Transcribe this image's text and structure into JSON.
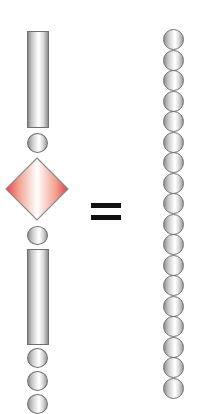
{
  "diagram": {
    "colors": {
      "cylinder_edge": "#6f6f6f",
      "bead_edge": "#707070",
      "diamond_fill_edge": "#e8404f",
      "diamond_fill_center": "#ffffff",
      "diamond_stroke": "#8a8a8a",
      "equals": "#111111"
    },
    "left_chain": {
      "elements": [
        {
          "type": "cylinder",
          "x": 27,
          "y": 31,
          "w": 22,
          "h": 97
        },
        {
          "type": "bead",
          "x": 27,
          "y": 133,
          "w": 21,
          "h": 20
        },
        {
          "type": "diamond",
          "cx": 37,
          "cy": 189,
          "size": 64
        },
        {
          "type": "bead",
          "x": 27,
          "y": 226,
          "w": 21,
          "h": 19
        },
        {
          "type": "cylinder",
          "x": 27,
          "y": 249,
          "w": 22,
          "h": 96
        },
        {
          "type": "bead",
          "x": 27,
          "y": 348,
          "w": 21,
          "h": 20
        },
        {
          "type": "bead",
          "x": 27,
          "y": 371,
          "w": 21,
          "h": 20
        },
        {
          "type": "bead",
          "x": 27,
          "y": 394,
          "w": 21,
          "h": 20
        }
      ]
    },
    "equals_symbol": {
      "symbol": "=",
      "x": 91,
      "y": 203,
      "w": 30,
      "bar_h": 5,
      "gap": 12
    },
    "right_chain": {
      "bead_count": 18,
      "x": 163,
      "start_y": 29,
      "spacing": 20.5,
      "w": 21,
      "h": 21
    }
  }
}
